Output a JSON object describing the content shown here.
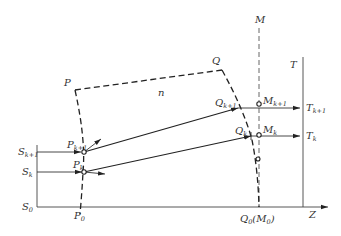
{
  "diagram": {
    "title": "",
    "labels": {
      "P": "P",
      "Q": "Q",
      "M": "M",
      "T": "T",
      "Z": "Z",
      "n": "n",
      "S_k1_main": "S",
      "S_k1_sub": "k+1",
      "S_k_main": "S",
      "S_k_sub": "k",
      "S_0_main": "S",
      "S_0_sub": "0",
      "P_k1_main": "P",
      "P_k1_sub": "k+1",
      "P_k_main": "P",
      "P_k_sub": "k",
      "P_0_main": "P",
      "P_0_sub": "0",
      "Q_k1_main": "Q",
      "Q_k1_sub": "k+1",
      "Q_k_main": "Q",
      "Q_k_sub": "k",
      "Q_0_main": "Q",
      "Q_0_sub": "0",
      "Q_0_paren_open": "(M",
      "Q_0_paren_sub": "0",
      "Q_0_paren_close": ")",
      "M_k1_main": "M",
      "M_k1_sub": "k+1",
      "M_k_main": "M",
      "M_k_sub": "k",
      "T_k1_main": "T",
      "T_k1_sub": "k+1",
      "T_k_main": "T",
      "T_k_sub": "k"
    }
  }
}
